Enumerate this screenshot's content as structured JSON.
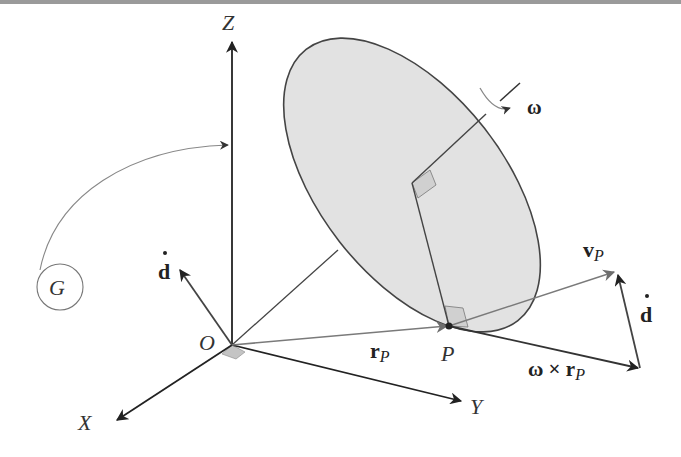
{
  "figure": {
    "colors": {
      "background": "#ffffff",
      "top_bar": "#9a9a9a",
      "disk_fill": "#e2e2e2",
      "disk_stroke": "#444444",
      "axis_stroke": "#333333",
      "vector_gray": "#7a7a7a",
      "shadow_fill": "#c4c4c4"
    }
  },
  "labels": {
    "z_axis": "Z",
    "x_axis": "X",
    "y_axis": "Y",
    "origin": "O",
    "point": "P",
    "body": "G",
    "omega": "ω",
    "d_dot_left": "d",
    "d_dot_right": "d",
    "r_p_main": "r",
    "r_p_sub": "P",
    "v_p_main": "v",
    "v_p_sub": "P",
    "omega_cross_main": "ω × r",
    "omega_cross_sub": "P"
  }
}
